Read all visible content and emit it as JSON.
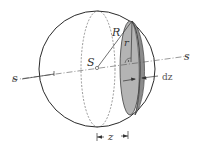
{
  "figure": {
    "labels": {
      "center": "S",
      "sphere_radius": "R",
      "slice_radius": "r",
      "axis_left": "s",
      "axis_right": "s",
      "thickness": "dz",
      "distance": "z"
    },
    "colors": {
      "outline": "#2a2a2a",
      "slice_fill": "#b4b4b4",
      "slice_edge_fill": "#8c8c8c",
      "background": "#ffffff"
    }
  }
}
